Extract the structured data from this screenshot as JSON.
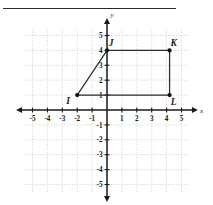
{
  "figure": {
    "top_rule": "",
    "axis_x_name": "x",
    "axis_y_name": "y"
  },
  "chart_data": {
    "type": "scatter",
    "title": "",
    "subtitle": "",
    "xlabel": "x",
    "ylabel": "y",
    "xlim": [
      -5.6,
      5.6
    ],
    "ylim": [
      -5.6,
      5.6
    ],
    "grid": true,
    "grid_step": 1,
    "grid_color": "#c8c8c8",
    "axis_color": "#1a1a1a",
    "legend": null,
    "xticks": [
      -5,
      -4,
      -3,
      -2,
      -1,
      1,
      2,
      3,
      4,
      5
    ],
    "yticks": [
      5,
      4,
      3,
      2,
      1,
      -1,
      -2,
      -3,
      -4,
      -5
    ],
    "xtick_labels": [
      "-5",
      "-4",
      "-3",
      "-2",
      "-1",
      "1",
      "2",
      "3",
      "4",
      "5"
    ],
    "ytick_labels": [
      "5",
      "4",
      "3",
      "2",
      "1",
      "-1",
      "-2",
      "-3",
      "-4",
      "-5"
    ],
    "points": [
      {
        "label": "I",
        "x": -2.0,
        "y": 1.0,
        "label_dx": -9,
        "label_dy": 9
      },
      {
        "label": "J",
        "x": 0.0,
        "y": 4.0,
        "label_dx": 4,
        "label_dy": -4
      },
      {
        "label": "K",
        "x": 4.2,
        "y": 4.0,
        "label_dx": 4,
        "label_dy": -4
      },
      {
        "label": "L",
        "x": 4.2,
        "y": 1.0,
        "label_dx": 4,
        "label_dy": 10
      }
    ],
    "shape": {
      "name": "quadrilateral-IJKL",
      "vertices": [
        "I",
        "J",
        "K",
        "L"
      ],
      "closed": true,
      "stroke": "#2b2b2b",
      "fill": "none"
    }
  }
}
